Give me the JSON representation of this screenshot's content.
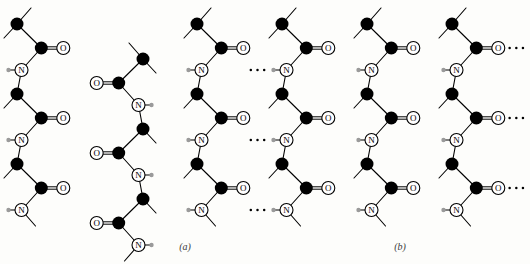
{
  "figure": {
    "kind": "chemical-structure-diagram",
    "background_color": "#fdfdfb",
    "panels": [
      {
        "id": "a",
        "label": "(a)",
        "label_x": 185,
        "label_y": 250,
        "arrangement": "antiparallel",
        "chain_count": 3
      },
      {
        "id": "b",
        "label": "(b)",
        "label_x": 400,
        "label_y": 250,
        "arrangement": "parallel",
        "chain_count": 3
      }
    ],
    "atom_types": {
      "carbon": {
        "symbol": "",
        "style": "filled-black-circle",
        "color": "#000000",
        "radius": 6.5
      },
      "oxygen": {
        "symbol": "O",
        "style": "open-circle-with-label",
        "color": "#ffffff",
        "stroke": "#000000",
        "radius": 6.5
      },
      "nitrogen": {
        "symbol": "N",
        "style": "open-circle-with-label",
        "color": "#ffffff",
        "stroke": "#000000",
        "radius": 6.5
      },
      "hydrogen": {
        "symbol": "",
        "style": "small-gray-circle",
        "color": "#9a9a9a",
        "radius": 2.2
      }
    },
    "bond_types": {
      "single": {
        "style": "solid-line",
        "color": "#000000",
        "width": 1.1
      },
      "double": {
        "style": "parallel-double-line",
        "color": "#000000",
        "width": 1.0,
        "gap": 2.4
      },
      "hydrogen_bond": {
        "style": "dotted-line",
        "color": "#000000",
        "dot_count": 3
      }
    },
    "geometry": {
      "repeat_height": 70,
      "panel_a_chain_x": [
        35,
        125,
        215
      ],
      "panel_b_chain_x": [
        300,
        385,
        470
      ],
      "zigzag_offset": 18,
      "side_group_length": 22
    },
    "panel_a_chains": [
      {
        "index": 0,
        "x": 35,
        "direction": "down",
        "nodes": [
          {
            "type": "carbon",
            "dx": -14,
            "y": 22,
            "terminal_bond": "up-left"
          },
          {
            "type": "carbon",
            "dx": 4,
            "y": 48,
            "carbonyl": "right"
          },
          {
            "type": "nitrogen",
            "dx": -12,
            "y": 72,
            "amide_h": "left"
          },
          {
            "type": "carbon",
            "dx": 6,
            "y": 96
          },
          {
            "type": "carbon",
            "dx": -6,
            "y": 118,
            "carbonyl": "left"
          },
          {
            "type": "nitrogen",
            "dx": 10,
            "y": 140,
            "amide_h": "right"
          },
          {
            "type": "carbon",
            "dx": -8,
            "y": 162
          },
          {
            "type": "carbon",
            "dx": 4,
            "y": 186,
            "carbonyl": "right"
          },
          {
            "type": "nitrogen",
            "dx": -12,
            "y": 208,
            "amide_h": "left"
          },
          {
            "type": "carbon",
            "dx": 6,
            "y": 232,
            "terminal_bond": "down-right"
          }
        ]
      },
      {
        "index": 1,
        "x": 125,
        "direction": "up",
        "mirrored": true
      },
      {
        "index": 2,
        "x": 215,
        "direction": "down",
        "mirrored": false
      }
    ],
    "panel_b_chains": [
      {
        "index": 0,
        "x": 300,
        "direction": "down",
        "mirrored": false
      },
      {
        "index": 1,
        "x": 385,
        "direction": "down",
        "mirrored": false
      },
      {
        "index": 2,
        "x": 470,
        "direction": "down",
        "mirrored": false
      }
    ],
    "hydrogen_bond_rows_a": [
      {
        "y": 48,
        "from": "chain0-carbonyl-O",
        "to": "chain1-amide-H",
        "direction": "left-to-right"
      },
      {
        "y": 72,
        "from": "chain2-amide-H",
        "to": "chain1-carbonyl-O",
        "direction": "right-to-left"
      },
      {
        "y": 118,
        "from": "chain1-amide-H",
        "to": "chain2-carbonyl-O",
        "direction": "left-to-right"
      },
      {
        "y": 140,
        "from": "chain0-amide-H",
        "to": "chain1-carbonyl-O",
        "direction": "left-to-right"
      },
      {
        "y": 186,
        "from": "chain0-carbonyl-O",
        "to": "chain1-amide-H",
        "direction": "left-to-right"
      },
      {
        "y": 208,
        "from": "chain1-carbonyl-O",
        "to": "chain2-amide-H",
        "direction": "left-to-right"
      }
    ],
    "hydrogen_bond_rows_b": [
      {
        "y": 60,
        "repeat": true,
        "note": "N-H on left, C=O on right of each chain"
      },
      {
        "y": 130,
        "repeat": true,
        "note": "mirrored row: O on left, N-H pointing right"
      },
      {
        "y": 200,
        "repeat": true,
        "note": "N-H on left, C=O on right of each chain"
      }
    ]
  }
}
